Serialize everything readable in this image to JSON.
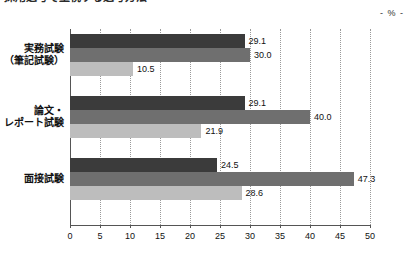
{
  "title": {
    "prefix": "図表",
    "text": "採用選考で重視する選考方法",
    "cut_off": true
  },
  "unit_label": "- % -",
  "chart_data": {
    "type": "bar",
    "orientation": "horizontal",
    "title": "採用選考で重視する選考方法",
    "xlabel": "",
    "ylabel": "",
    "unit": "%",
    "xlim": [
      0,
      50
    ],
    "xticks": [
      0,
      5,
      10,
      15,
      20,
      25,
      30,
      35,
      40,
      45,
      50
    ],
    "grid": true,
    "legend": "none",
    "categories": [
      "実務試験\n（筆記試験）",
      "論文・\nレポート試験",
      "面接試験"
    ],
    "series": [
      {
        "name": "series-1",
        "color": "#3b3b3b",
        "values": [
          29.1,
          29.1,
          24.5
        ]
      },
      {
        "name": "series-2",
        "color": "#6f6f6f",
        "values": [
          30.0,
          40.0,
          47.3
        ]
      },
      {
        "name": "series-3",
        "color": "#bdbdbd",
        "values": [
          10.5,
          21.9,
          28.6
        ]
      }
    ]
  },
  "categories": [
    {
      "lines": [
        "実務試験",
        "（筆記試験）"
      ]
    },
    {
      "lines": [
        "論文・",
        "レポート試験"
      ]
    },
    {
      "lines": [
        "面接試験"
      ]
    }
  ],
  "bars": [
    [
      {
        "value": 29.1,
        "label": "29.1",
        "color": "#3b3b3b"
      },
      {
        "value": 30.0,
        "label": "30.0",
        "color": "#6f6f6f"
      },
      {
        "value": 10.5,
        "label": "10.5",
        "color": "#bdbdbd"
      }
    ],
    [
      {
        "value": 29.1,
        "label": "29.1",
        "color": "#3b3b3b"
      },
      {
        "value": 40.0,
        "label": "40.0",
        "color": "#6f6f6f"
      },
      {
        "value": 21.9,
        "label": "21.9",
        "color": "#bdbdbd"
      }
    ],
    [
      {
        "value": 24.5,
        "label": "24.5",
        "color": "#3b3b3b"
      },
      {
        "value": 47.3,
        "label": "47.3",
        "color": "#6f6f6f"
      },
      {
        "value": 28.6,
        "label": "28.6",
        "color": "#bdbdbd"
      }
    ]
  ],
  "xticks": [
    {
      "label": "0",
      "value": 0
    },
    {
      "label": "5",
      "value": 5
    },
    {
      "label": "10",
      "value": 10
    },
    {
      "label": "15",
      "value": 15
    },
    {
      "label": "20",
      "value": 20
    },
    {
      "label": "25",
      "value": 25
    },
    {
      "label": "30",
      "value": 30
    },
    {
      "label": "35",
      "value": 35
    },
    {
      "label": "40",
      "value": 40
    },
    {
      "label": "45",
      "value": 45
    },
    {
      "label": "50",
      "value": 50
    }
  ],
  "colors": {
    "series1": "#3b3b3b",
    "series2": "#6f6f6f",
    "series3": "#bdbdbd",
    "axis": "#555555",
    "grid": "#9a9a9a",
    "background": "#ffffff"
  }
}
